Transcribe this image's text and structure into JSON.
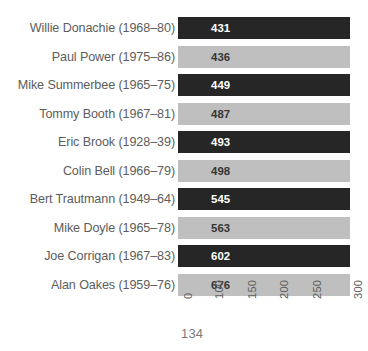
{
  "page": {
    "page_number": "134",
    "background_color": "#ffffff"
  },
  "colors": {
    "bar_dark": "#262626",
    "bar_light": "#bfbfbf",
    "label_text": "#5d5d5d",
    "value_on_dark": "#ffffff",
    "value_on_light": "#363636",
    "page_number_text": "#7a7a7a"
  },
  "chart_data": {
    "type": "bar",
    "orientation": "horizontal",
    "title": "",
    "subtitle": "",
    "xlabel": "",
    "ylabel": "",
    "grid": false,
    "legend": false,
    "xlim": [
      0,
      300
    ],
    "axis_ticks": [
      {
        "value": 0,
        "label": "0",
        "x": 181.5
      },
      {
        "value": 100,
        "label": "100",
        "x": 213.0
      },
      {
        "value": 150,
        "label": "150",
        "x": 245.5
      },
      {
        "value": 200,
        "label": "200",
        "x": 278.0
      },
      {
        "value": 250,
        "label": "250",
        "x": 310.5
      },
      {
        "value": 300,
        "label": "300",
        "x": 352.0
      }
    ],
    "categories": [
      "Willie Donachie (1968–80)",
      "Paul Power (1975–86)",
      "Mike Summerbee (1965–75)",
      "Tommy Booth (1967–81)",
      "Eric Brook (1928–39)",
      "Colin Bell (1966–79)",
      "Bert Trautmann (1949–64)",
      "Mike Doyle (1965–78)",
      "Joe Corrigan (1967–83)",
      "Alan Oakes (1959–76)"
    ],
    "values": [
      431,
      436,
      449,
      487,
      493,
      498,
      545,
      563,
      602,
      676
    ],
    "value_labels": [
      "431",
      "436",
      "449",
      "487",
      "493",
      "498",
      "545",
      "563",
      "602",
      "676"
    ],
    "bar_styles": [
      "dark",
      "light",
      "dark",
      "light",
      "dark",
      "light",
      "dark",
      "light",
      "dark",
      "light"
    ],
    "bars": [
      {
        "category": "Willie Donachie (1968–80)",
        "value": 431,
        "label": "431",
        "style": "dark",
        "width_px": 172
      },
      {
        "category": "Paul Power (1975–86)",
        "value": 436,
        "label": "436",
        "style": "light",
        "width_px": 172
      },
      {
        "category": "Mike Summerbee (1965–75)",
        "value": 449,
        "label": "449",
        "style": "dark",
        "width_px": 172
      },
      {
        "category": "Tommy Booth (1967–81)",
        "value": 487,
        "label": "487",
        "style": "light",
        "width_px": 172
      },
      {
        "category": "Eric Brook (1928–39)",
        "value": 493,
        "label": "493",
        "style": "dark",
        "width_px": 172
      },
      {
        "category": "Colin Bell (1966–79)",
        "value": 498,
        "label": "498",
        "style": "light",
        "width_px": 172
      },
      {
        "category": "Bert Trautmann (1949–64)",
        "value": 545,
        "label": "545",
        "style": "dark",
        "width_px": 172
      },
      {
        "category": "Mike Doyle (1965–78)",
        "value": 563,
        "label": "563",
        "style": "light",
        "width_px": 172
      },
      {
        "category": "Joe Corrigan (1967–83)",
        "value": 602,
        "label": "602",
        "style": "dark",
        "width_px": 172
      },
      {
        "category": "Alan Oakes (1959–76)",
        "value": 676,
        "label": "676",
        "style": "light",
        "width_px": 172
      }
    ]
  }
}
